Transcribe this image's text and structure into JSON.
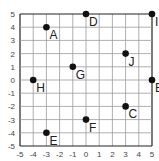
{
  "chart_data": {
    "type": "scatter",
    "title": "",
    "xlabel": "",
    "ylabel": "",
    "xlim": [
      -5,
      5
    ],
    "ylim": [
      -5,
      5
    ],
    "grid": true,
    "x_ticks": [
      "-5",
      "-4",
      "-3",
      "-2",
      "-1",
      "0",
      "1",
      "2",
      "3",
      "4",
      "5"
    ],
    "y_ticks": [
      "5",
      "4",
      "3",
      "2",
      "1",
      "0",
      "-1",
      "-2",
      "-3",
      "-4",
      "-5"
    ],
    "points": [
      {
        "label": "A",
        "x": -3,
        "y": 4
      },
      {
        "label": "B",
        "x": 5,
        "y": 0
      },
      {
        "label": "C",
        "x": 3,
        "y": -2
      },
      {
        "label": "D",
        "x": 0,
        "y": 5
      },
      {
        "label": "E",
        "x": -3,
        "y": -4
      },
      {
        "label": "F",
        "x": 0,
        "y": -3
      },
      {
        "label": "G",
        "x": -1,
        "y": 1
      },
      {
        "label": "H",
        "x": -4,
        "y": 0
      },
      {
        "label": "I",
        "x": 5,
        "y": 5
      },
      {
        "label": "J",
        "x": 3,
        "y": 2
      }
    ]
  }
}
